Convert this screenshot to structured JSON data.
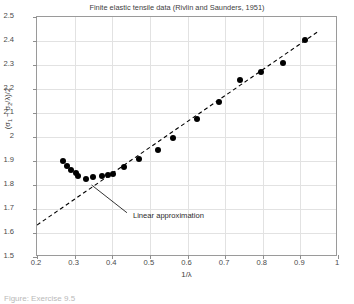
{
  "chart_data": {
    "type": "scatter",
    "title": "Finite elastic tensile data (Rivlin and Saunders, 1951)",
    "xlabel": "1/λ",
    "ylabel": "(σ₁ − σ₂/λ)/2",
    "xlim": [
      0.2,
      1.0
    ],
    "ylim": [
      1.5,
      2.5
    ],
    "grid": true,
    "legend": "none",
    "xticks": [
      "0.2",
      "0.3",
      "0.4",
      "0.5",
      "0.6",
      "0.7",
      "0.8",
      "0.9",
      "1"
    ],
    "xtick_values": [
      0.2,
      0.3,
      0.4,
      0.5,
      0.6,
      0.7,
      0.8,
      0.9,
      1.0
    ],
    "yticks": [
      "1.5",
      "1.6",
      "1.7",
      "1.8",
      "1.9",
      "2",
      "2.1",
      "2.2",
      "2.3",
      "2.4",
      "2.5"
    ],
    "ytick_values": [
      1.5,
      1.6,
      1.7,
      1.8,
      1.9,
      2.0,
      2.1,
      2.2,
      2.3,
      2.4,
      2.5
    ],
    "series": [
      {
        "name": "Experimental data",
        "marker": "filled-circle",
        "color": "#000000",
        "x": [
          0.269,
          0.279,
          0.291,
          0.303,
          0.31,
          0.331,
          0.349,
          0.372,
          0.388,
          0.402,
          0.432,
          0.47,
          0.521,
          0.562,
          0.626,
          0.683,
          0.74,
          0.795,
          0.853,
          0.913
        ],
        "y": [
          1.899,
          1.879,
          1.862,
          1.849,
          1.838,
          1.827,
          1.832,
          1.838,
          1.841,
          1.847,
          1.876,
          1.909,
          1.947,
          1.997,
          2.077,
          2.146,
          2.237,
          2.272,
          2.307,
          2.406
        ]
      }
    ],
    "fit_line": {
      "name": "Linear approximation",
      "style": "dashed",
      "color": "#000000",
      "x": [
        0.2,
        0.945
      ],
      "y": [
        1.633,
        2.437
      ]
    },
    "annotation": {
      "text": "Linear approximation",
      "x": 0.455,
      "y": 1.672,
      "arrow_to_x": 0.345,
      "arrow_to_y": 1.8
    }
  },
  "caption": {
    "text": "Figure: Exercise 9.5"
  }
}
